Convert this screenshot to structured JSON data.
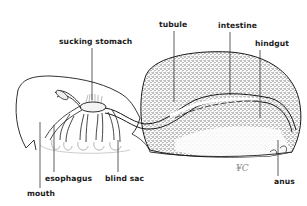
{
  "diagram": {
    "labels": {
      "sucking_stomach": "sucking stomach",
      "tubule": "tubule",
      "intestine": "intestine",
      "hindgut": "hindgut",
      "mouth": "mouth",
      "esophagus": "esophagus",
      "blind_sac": "blind sac",
      "anus": "anus"
    },
    "signature": "¥C",
    "colors": {
      "ink": "#1a1a1a",
      "stipple": "#6a6a6a",
      "background": "#ffffff"
    }
  }
}
